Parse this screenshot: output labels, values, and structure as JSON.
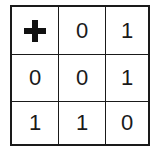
{
  "grid": {
    "rows": [
      [
        "+",
        "0",
        "1"
      ],
      [
        "0",
        "0",
        "1"
      ],
      [
        "1",
        "1",
        "0"
      ]
    ],
    "r0c1": "0",
    "r0c2": "1",
    "r1c0": "0",
    "r1c1": "0",
    "r1c2": "1",
    "r2c0": "1",
    "r2c1": "1",
    "r2c2": "0",
    "marker_icon": "plus-icon"
  }
}
